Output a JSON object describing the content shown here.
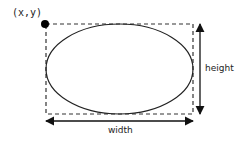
{
  "diagram": {
    "type": "ellipse-bounding-box",
    "origin_label": "(x,y)",
    "width_label": "width",
    "height_label": "height",
    "colors": {
      "stroke": "#222222",
      "dashed_box": "#333333",
      "dot": "#000000",
      "background": "#ffffff"
    },
    "geometry": {
      "box": {
        "x": 46,
        "y": 24,
        "width": 147,
        "height": 90
      },
      "ellipse": {
        "cx": 119.5,
        "cy": 69,
        "rx": 73.5,
        "ry": 45
      },
      "origin_dot": {
        "cx": 45,
        "cy": 24,
        "r": 4
      },
      "width_arrow": {
        "x1": 46,
        "x2": 193,
        "y": 121
      },
      "height_arrow": {
        "x": 200,
        "y1": 24,
        "y2": 114
      }
    }
  }
}
